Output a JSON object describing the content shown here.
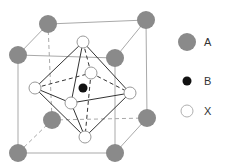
{
  "diagram": {
    "colors": {
      "A": "#8a8a8a",
      "B": "#111111",
      "X": "#ffffff",
      "X_stroke": "#9a9a9a",
      "cube_edge": "#a9a9a9",
      "octahedron_edge": "#333333"
    },
    "legend": [
      {
        "key": "A",
        "label": "A",
        "icon": "gray-filled-circle"
      },
      {
        "key": "B",
        "label": "B",
        "icon": "black-filled-circle"
      },
      {
        "key": "X",
        "label": "X",
        "icon": "white-open-circle"
      }
    ]
  }
}
